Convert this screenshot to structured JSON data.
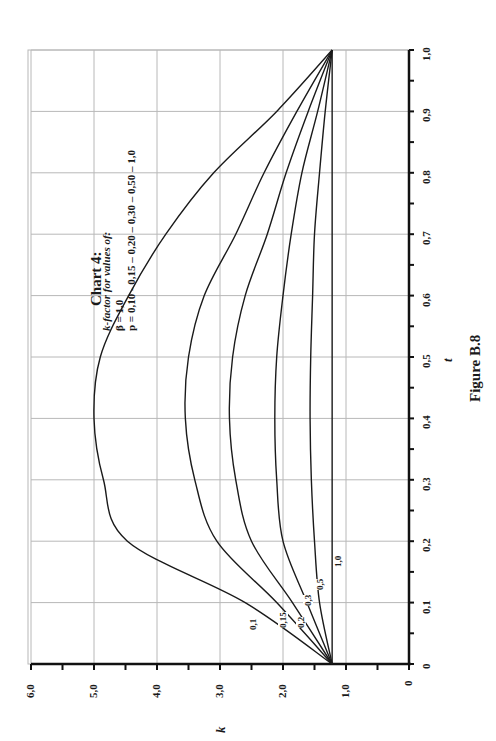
{
  "chart_data": {
    "type": "line",
    "title": "Chart 4:",
    "subtitle_lines": [
      "k-factor for values of:",
      "β = 1,0",
      "p = 0,10 - 0,15 – 0,20 – 0,30 – 0,50 – 1,0"
    ],
    "xlabel": "t",
    "ylabel": "k",
    "caption": "Figure B.8",
    "orientation": "rotated 90° counter-clockwise (t axis vertical at right, k axis horizontal at bottom)",
    "x": [
      0,
      0.1,
      0.2,
      0.3,
      0.4,
      0.5,
      0.6,
      0.7,
      0.8,
      0.9,
      1.0
    ],
    "xlim": [
      0,
      1.0
    ],
    "ylim": [
      0,
      6.0
    ],
    "x_ticks": [
      "0",
      "0,1",
      "0,2",
      "0,3",
      "0,4",
      "0,5",
      "0,6",
      "0,7",
      "0,8",
      "0,9",
      "1,0"
    ],
    "y_ticks": [
      "0",
      "1,0",
      "2,0",
      "3,0",
      "4,0",
      "5,0",
      "6,0"
    ],
    "grid": true,
    "legend": "inline curve labels",
    "series": [
      {
        "name": "0,1",
        "values": [
          1.22,
          2.6,
          4.47,
          4.85,
          5.0,
          4.9,
          4.45,
          3.86,
          3.1,
          2.1,
          1.22
        ]
      },
      {
        "name": "0,15",
        "values": [
          1.22,
          2.1,
          3.05,
          3.4,
          3.55,
          3.5,
          3.25,
          2.75,
          2.3,
          1.78,
          1.22
        ]
      },
      {
        "name": "0,2",
        "values": [
          1.22,
          1.85,
          2.5,
          2.75,
          2.85,
          2.8,
          2.6,
          2.25,
          1.95,
          1.6,
          1.22
        ]
      },
      {
        "name": "0,3",
        "values": [
          1.22,
          1.62,
          2.0,
          2.1,
          2.13,
          2.1,
          2.0,
          1.87,
          1.7,
          1.45,
          1.22
        ]
      },
      {
        "name": "0,5",
        "values": [
          1.22,
          1.42,
          1.5,
          1.55,
          1.57,
          1.56,
          1.53,
          1.5,
          1.42,
          1.33,
          1.22
        ]
      },
      {
        "name": "1,0",
        "values": [
          1.22,
          1.22,
          1.22,
          1.22,
          1.22,
          1.22,
          1.22,
          1.22,
          1.22,
          1.22,
          1.22
        ]
      }
    ],
    "colors": {
      "line": "#1a1a1a",
      "grid": "#b8b8b8",
      "axis": "#111111"
    }
  }
}
